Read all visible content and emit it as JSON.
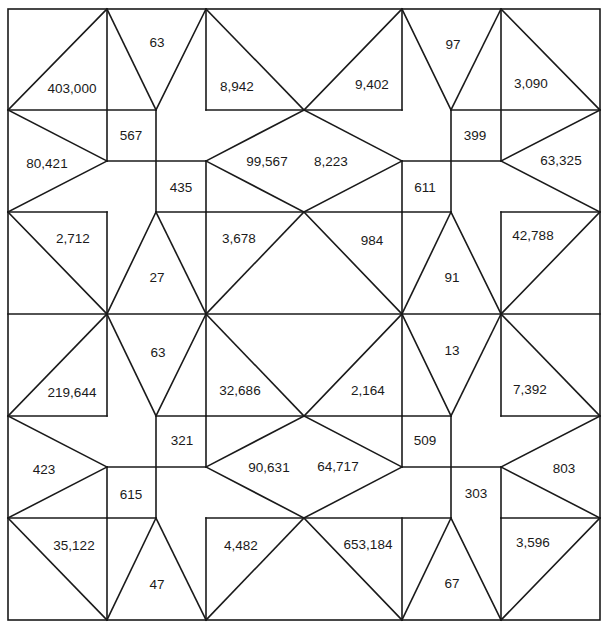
{
  "diagram": {
    "colors": {
      "background": "#ffffff",
      "ink": "#1a1a1a"
    },
    "grid": {
      "columns": [
        8,
        107,
        156,
        206,
        304,
        402,
        451,
        501,
        600
      ],
      "rows": [
        9,
        110,
        161,
        212,
        314,
        416,
        467,
        518,
        620
      ]
    },
    "outline": {
      "x": 8,
      "y": 9,
      "width": 592,
      "height": 611
    },
    "lines": [
      [
        8,
        110,
        156,
        110
      ],
      [
        206,
        110,
        402,
        110
      ],
      [
        451,
        110,
        600,
        110
      ],
      [
        107,
        161,
        206,
        161
      ],
      [
        402,
        161,
        501,
        161
      ],
      [
        8,
        212,
        107,
        212
      ],
      [
        156,
        212,
        451,
        212
      ],
      [
        501,
        212,
        600,
        212
      ],
      [
        8,
        314,
        600,
        314
      ],
      [
        8,
        416,
        107,
        416
      ],
      [
        156,
        416,
        451,
        416
      ],
      [
        501,
        416,
        600,
        416
      ],
      [
        107,
        467,
        206,
        467
      ],
      [
        402,
        467,
        501,
        467
      ],
      [
        8,
        518,
        156,
        518
      ],
      [
        206,
        518,
        451,
        518
      ],
      [
        501,
        518,
        600,
        518
      ],
      [
        107,
        9,
        107,
        161
      ],
      [
        156,
        110,
        156,
        212
      ],
      [
        206,
        161,
        206,
        212
      ],
      [
        402,
        9,
        402,
        110
      ],
      [
        451,
        110,
        451,
        212
      ],
      [
        402,
        161,
        402,
        212
      ],
      [
        501,
        9,
        501,
        161
      ],
      [
        206,
        9,
        206,
        110
      ],
      [
        107,
        212,
        107,
        416
      ],
      [
        206,
        212,
        206,
        416
      ],
      [
        402,
        212,
        402,
        416
      ],
      [
        501,
        212,
        501,
        416
      ],
      [
        206,
        416,
        206,
        467
      ],
      [
        156,
        416,
        156,
        518
      ],
      [
        107,
        467,
        107,
        518
      ],
      [
        402,
        416,
        402,
        467
      ],
      [
        451,
        416,
        451,
        518
      ],
      [
        501,
        467,
        501,
        518
      ],
      [
        107,
        518,
        107,
        620
      ],
      [
        206,
        518,
        206,
        620
      ],
      [
        402,
        518,
        402,
        620
      ],
      [
        501,
        518,
        501,
        620
      ],
      [
        8,
        110,
        107,
        9
      ],
      [
        107,
        9,
        156,
        110
      ],
      [
        206,
        9,
        156,
        110
      ],
      [
        206,
        9,
        304,
        110
      ],
      [
        304,
        110,
        402,
        9
      ],
      [
        402,
        9,
        451,
        110
      ],
      [
        501,
        9,
        451,
        110
      ],
      [
        501,
        9,
        600,
        110
      ],
      [
        8,
        110,
        107,
        161
      ],
      [
        8,
        212,
        107,
        161
      ],
      [
        304,
        110,
        206,
        161
      ],
      [
        304,
        212,
        206,
        161
      ],
      [
        304,
        110,
        402,
        161
      ],
      [
        304,
        212,
        402,
        161
      ],
      [
        600,
        110,
        501,
        161
      ],
      [
        600,
        212,
        501,
        161
      ],
      [
        8,
        212,
        107,
        314
      ],
      [
        156,
        212,
        107,
        314
      ],
      [
        156,
        212,
        206,
        314
      ],
      [
        304,
        212,
        206,
        314
      ],
      [
        304,
        212,
        402,
        314
      ],
      [
        451,
        212,
        402,
        314
      ],
      [
        451,
        212,
        501,
        314
      ],
      [
        600,
        212,
        501,
        314
      ],
      [
        8,
        416,
        107,
        314
      ],
      [
        107,
        314,
        156,
        416
      ],
      [
        206,
        314,
        156,
        416
      ],
      [
        206,
        314,
        304,
        416
      ],
      [
        304,
        416,
        402,
        314
      ],
      [
        402,
        314,
        451,
        416
      ],
      [
        501,
        314,
        451,
        416
      ],
      [
        501,
        314,
        600,
        416
      ],
      [
        8,
        416,
        107,
        467
      ],
      [
        8,
        518,
        107,
        467
      ],
      [
        304,
        416,
        206,
        467
      ],
      [
        304,
        518,
        206,
        467
      ],
      [
        304,
        416,
        402,
        467
      ],
      [
        304,
        518,
        402,
        467
      ],
      [
        600,
        416,
        501,
        467
      ],
      [
        600,
        518,
        501,
        467
      ],
      [
        8,
        518,
        107,
        620
      ],
      [
        156,
        518,
        107,
        620
      ],
      [
        156,
        518,
        206,
        620
      ],
      [
        304,
        518,
        206,
        620
      ],
      [
        304,
        518,
        402,
        620
      ],
      [
        451,
        518,
        402,
        620
      ],
      [
        451,
        518,
        501,
        620
      ],
      [
        600,
        518,
        501,
        620
      ]
    ],
    "labels": [
      {
        "text": "403,000",
        "x": 72,
        "y": 88
      },
      {
        "text": "63",
        "x": 157,
        "y": 42
      },
      {
        "text": "8,942",
        "x": 237,
        "y": 86
      },
      {
        "text": "9,402",
        "x": 372,
        "y": 84
      },
      {
        "text": "97",
        "x": 453,
        "y": 44
      },
      {
        "text": "3,090",
        "x": 531,
        "y": 83
      },
      {
        "text": "80,421",
        "x": 47,
        "y": 163
      },
      {
        "text": "567",
        "x": 131,
        "y": 135
      },
      {
        "text": "435",
        "x": 181,
        "y": 187
      },
      {
        "text": "99,567",
        "x": 267,
        "y": 161
      },
      {
        "text": "8,223",
        "x": 331,
        "y": 161
      },
      {
        "text": "611",
        "x": 425,
        "y": 187
      },
      {
        "text": "399",
        "x": 475,
        "y": 135
      },
      {
        "text": "63,325",
        "x": 561,
        "y": 160
      },
      {
        "text": "2,712",
        "x": 73,
        "y": 238
      },
      {
        "text": "27",
        "x": 157,
        "y": 277
      },
      {
        "text": "3,678",
        "x": 239,
        "y": 238
      },
      {
        "text": "984",
        "x": 372,
        "y": 240
      },
      {
        "text": "91",
        "x": 452,
        "y": 277
      },
      {
        "text": "42,788",
        "x": 533,
        "y": 235
      },
      {
        "text": "219,644",
        "x": 72,
        "y": 392
      },
      {
        "text": "63",
        "x": 158,
        "y": 352
      },
      {
        "text": "32,686",
        "x": 240,
        "y": 390
      },
      {
        "text": "2,164",
        "x": 368,
        "y": 390
      },
      {
        "text": "13",
        "x": 452,
        "y": 350
      },
      {
        "text": "7,392",
        "x": 530,
        "y": 389
      },
      {
        "text": "423",
        "x": 44,
        "y": 469
      },
      {
        "text": "321",
        "x": 182,
        "y": 440
      },
      {
        "text": "615",
        "x": 131,
        "y": 494
      },
      {
        "text": "90,631",
        "x": 269,
        "y": 467
      },
      {
        "text": "64,717",
        "x": 338,
        "y": 466
      },
      {
        "text": "509",
        "x": 425,
        "y": 440
      },
      {
        "text": "303",
        "x": 476,
        "y": 493
      },
      {
        "text": "803",
        "x": 564,
        "y": 468
      },
      {
        "text": "35,122",
        "x": 74,
        "y": 545
      },
      {
        "text": "47",
        "x": 157,
        "y": 584
      },
      {
        "text": "4,482",
        "x": 241,
        "y": 545
      },
      {
        "text": "653,184",
        "x": 368,
        "y": 544
      },
      {
        "text": "67",
        "x": 452,
        "y": 583
      },
      {
        "text": "3,596",
        "x": 533,
        "y": 542
      }
    ]
  }
}
